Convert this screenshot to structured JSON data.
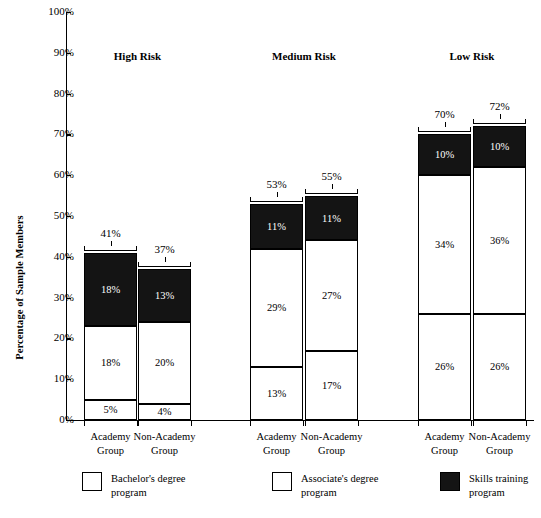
{
  "chart_data": {
    "type": "bar",
    "subtype": "stacked-bar-grouped",
    "title": "",
    "xlabel": "",
    "ylabel": "Percentage of Sample Members",
    "ylim": [
      0,
      100
    ],
    "ytick_labels": [
      "100%",
      "90%",
      "80%",
      "70%",
      "60%",
      "50%",
      "40%",
      "30%",
      "20%",
      "10%",
      "0%"
    ],
    "ytick_values": [
      100,
      90,
      80,
      70,
      60,
      50,
      40,
      30,
      20,
      10,
      0
    ],
    "grid": false,
    "legend_position": "bottom",
    "series": [
      {
        "name": "Bachelor's degree program",
        "color": "#ffffff",
        "values": [
          5,
          4,
          13,
          17,
          26,
          26
        ]
      },
      {
        "name": "Associate's degree program",
        "color": "#ffffff",
        "values": [
          18,
          20,
          29,
          27,
          34,
          36
        ]
      },
      {
        "name": "Skills training program",
        "color": "#141414",
        "values": [
          18,
          13,
          11,
          11,
          10,
          10
        ]
      }
    ],
    "categories": [
      "Academy Group",
      "Non-Academy Group",
      "Academy Group",
      "Non-Academy Group",
      "Academy Group",
      "Non-Academy Group"
    ],
    "group_labels": [
      "High Risk",
      "Medium Risk",
      "Low Risk"
    ],
    "totals": [
      41,
      37,
      53,
      55,
      70,
      72
    ]
  },
  "axis": {
    "y_title": "Percentage of Sample Members",
    "y_ticks": [
      {
        "label": "100%",
        "value": 100
      },
      {
        "label": "90%",
        "value": 90
      },
      {
        "label": "80%",
        "value": 80
      },
      {
        "label": "70%",
        "value": 70
      },
      {
        "label": "60%",
        "value": 60
      },
      {
        "label": "50%",
        "value": 50
      },
      {
        "label": "40%",
        "value": 40
      },
      {
        "label": "30%",
        "value": 30
      },
      {
        "label": "20%",
        "value": 20
      },
      {
        "label": "10%",
        "value": 10
      },
      {
        "label": "0%",
        "value": 0
      }
    ]
  },
  "groups": [
    {
      "header": "High Risk",
      "bars": [
        {
          "x_label_line1": "Academy",
          "x_label_line2": "Group",
          "total_label": "41%",
          "segments": [
            {
              "label": "5%",
              "value": 5,
              "style": "light"
            },
            {
              "label": "18%",
              "value": 18,
              "style": "light"
            },
            {
              "label": "18%",
              "value": 18,
              "style": "dark"
            }
          ]
        },
        {
          "x_label_line1": "Non-Academy",
          "x_label_line2": "Group",
          "total_label": "37%",
          "segments": [
            {
              "label": "4%",
              "value": 4,
              "style": "light"
            },
            {
              "label": "20%",
              "value": 20,
              "style": "light"
            },
            {
              "label": "13%",
              "value": 13,
              "style": "dark"
            }
          ]
        }
      ]
    },
    {
      "header": "Medium Risk",
      "bars": [
        {
          "x_label_line1": "Academy",
          "x_label_line2": "Group",
          "total_label": "53%",
          "segments": [
            {
              "label": "13%",
              "value": 13,
              "style": "light"
            },
            {
              "label": "29%",
              "value": 29,
              "style": "light"
            },
            {
              "label": "11%",
              "value": 11,
              "style": "dark"
            }
          ]
        },
        {
          "x_label_line1": "Non-Academy",
          "x_label_line2": "Group",
          "total_label": "55%",
          "segments": [
            {
              "label": "17%",
              "value": 17,
              "style": "light"
            },
            {
              "label": "27%",
              "value": 27,
              "style": "light"
            },
            {
              "label": "11%",
              "value": 11,
              "style": "dark"
            }
          ]
        }
      ]
    },
    {
      "header": "Low Risk",
      "bars": [
        {
          "x_label_line1": "Academy",
          "x_label_line2": "Group",
          "total_label": "70%",
          "segments": [
            {
              "label": "26%",
              "value": 26,
              "style": "light"
            },
            {
              "label": "34%",
              "value": 34,
              "style": "light"
            },
            {
              "label": "10%",
              "value": 10,
              "style": "dark"
            }
          ]
        },
        {
          "x_label_line1": "Non-Academy",
          "x_label_line2": "Group",
          "total_label": "72%",
          "segments": [
            {
              "label": "26%",
              "value": 26,
              "style": "light"
            },
            {
              "label": "36%",
              "value": 36,
              "style": "light"
            },
            {
              "label": "10%",
              "value": 10,
              "style": "dark"
            }
          ]
        }
      ]
    }
  ],
  "legend": [
    {
      "style": "light",
      "line1": "Bachelor's degree",
      "line2": "program"
    },
    {
      "style": "light",
      "line1": "Associate's degree",
      "line2": "program"
    },
    {
      "style": "dark",
      "line1": "Skills training",
      "line2": "program"
    }
  ],
  "colors": {
    "light_fill": "#ffffff",
    "dark_fill": "#141414",
    "stroke": "#000000"
  }
}
